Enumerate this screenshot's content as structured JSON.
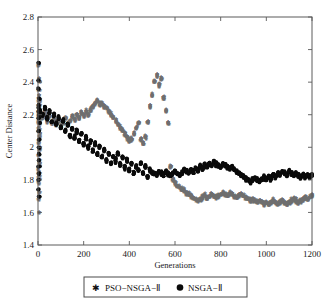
{
  "figure": {
    "width": 330,
    "height": 303,
    "background": "#ffffff"
  },
  "chart_data": {
    "type": "scatter",
    "title": "",
    "xlabel": "Generations",
    "ylabel": "Center Distance",
    "xlim": [
      0,
      1200
    ],
    "ylim": [
      1.4,
      2.8
    ],
    "xticks": [
      0,
      200,
      400,
      600,
      800,
      1000,
      1200
    ],
    "yticks": [
      1.4,
      1.6,
      1.8,
      2,
      2.2,
      2.4,
      2.6,
      2.8
    ],
    "xtick_labels": [
      "0",
      "200",
      "400",
      "600",
      "800",
      "1000",
      "1200"
    ],
    "ytick_labels": [
      "1.4",
      "1.6",
      "1.8",
      "2",
      "2.2",
      "2.4",
      "2.6",
      "2.8"
    ],
    "grid": false,
    "frame": "box",
    "tick_direction": "in",
    "legend_position": "below-axes",
    "series": [
      {
        "name": "PSO−NSGA−Ⅱ",
        "marker": "star",
        "color": "#6e6e6e",
        "x": [
          0,
          0,
          0,
          0,
          0,
          0,
          0,
          0,
          0,
          0,
          0,
          0,
          0,
          0,
          0,
          0,
          0,
          0,
          0,
          0,
          0,
          0,
          0,
          0,
          0,
          0,
          0,
          0,
          0,
          0,
          0,
          0,
          0,
          0,
          0,
          0,
          0,
          0,
          0,
          0,
          10,
          20,
          30,
          40,
          50,
          60,
          70,
          80,
          90,
          100,
          110,
          120,
          130,
          140,
          150,
          160,
          170,
          180,
          190,
          200,
          210,
          220,
          230,
          240,
          250,
          260,
          270,
          280,
          290,
          300,
          310,
          320,
          330,
          340,
          350,
          360,
          370,
          380,
          390,
          400,
          410,
          420,
          430,
          440,
          450,
          460,
          470,
          480,
          490,
          500,
          510,
          520,
          530,
          540,
          550,
          560,
          570,
          580,
          590,
          600,
          610,
          620,
          630,
          640,
          650,
          660,
          670,
          680,
          690,
          700,
          710,
          720,
          730,
          740,
          750,
          760,
          770,
          780,
          790,
          800,
          810,
          820,
          830,
          840,
          850,
          860,
          870,
          880,
          890,
          900,
          910,
          920,
          930,
          940,
          950,
          960,
          970,
          980,
          990,
          1000,
          1010,
          1020,
          1030,
          1040,
          1050,
          1060,
          1070,
          1080,
          1090,
          1100,
          1110,
          1120,
          1130,
          1140,
          1150,
          1160,
          1170,
          1180,
          1190,
          1200
        ],
        "y": [
          2.5,
          2.42,
          2.4,
          2.35,
          2.32,
          2.3,
          2.28,
          2.26,
          2.25,
          2.24,
          2.23,
          2.22,
          2.21,
          2.2,
          2.19,
          2.18,
          2.17,
          2.16,
          2.15,
          2.14,
          2.12,
          2.1,
          2.08,
          2.06,
          2.04,
          2.02,
          2.0,
          1.98,
          1.95,
          1.92,
          1.9,
          1.88,
          1.86,
          1.84,
          1.82,
          1.8,
          1.78,
          1.72,
          1.68,
          1.6,
          2.2,
          2.18,
          2.21,
          2.16,
          2.19,
          2.15,
          2.17,
          2.14,
          2.16,
          2.13,
          2.15,
          2.18,
          2.14,
          2.16,
          2.19,
          2.17,
          2.2,
          2.18,
          2.21,
          2.19,
          2.22,
          2.2,
          2.23,
          2.25,
          2.27,
          2.28,
          2.26,
          2.27,
          2.25,
          2.24,
          2.22,
          2.2,
          2.18,
          2.16,
          2.14,
          2.12,
          2.1,
          2.08,
          2.06,
          2.04,
          2.05,
          2.08,
          2.12,
          2.15,
          2.05,
          2.02,
          2.06,
          2.15,
          2.25,
          2.32,
          2.4,
          2.44,
          2.38,
          2.42,
          2.3,
          2.22,
          2.15,
          1.88,
          1.8,
          1.78,
          1.76,
          1.75,
          1.74,
          1.73,
          1.72,
          1.71,
          1.7,
          1.69,
          1.68,
          1.67,
          1.68,
          1.69,
          1.7,
          1.69,
          1.7,
          1.71,
          1.7,
          1.69,
          1.7,
          1.71,
          1.72,
          1.71,
          1.7,
          1.72,
          1.71,
          1.7,
          1.69,
          1.7,
          1.71,
          1.7,
          1.69,
          1.68,
          1.67,
          1.68,
          1.67,
          1.66,
          1.67,
          1.66,
          1.65,
          1.66,
          1.65,
          1.66,
          1.67,
          1.66,
          1.65,
          1.66,
          1.67,
          1.66,
          1.65,
          1.66,
          1.67,
          1.68,
          1.67,
          1.66,
          1.67,
          1.68,
          1.69,
          1.68,
          1.69,
          1.7
        ]
      },
      {
        "name": "NSGA−Ⅱ",
        "marker": "circle",
        "color": "#0a0a0a",
        "x": [
          0,
          0,
          0,
          0,
          0,
          0,
          0,
          0,
          0,
          0,
          0,
          0,
          0,
          0,
          0,
          0,
          0,
          0,
          0,
          0,
          10,
          20,
          30,
          40,
          50,
          60,
          70,
          80,
          90,
          100,
          110,
          120,
          130,
          140,
          150,
          160,
          170,
          180,
          190,
          200,
          210,
          220,
          230,
          240,
          250,
          260,
          270,
          280,
          290,
          300,
          310,
          320,
          330,
          340,
          350,
          360,
          370,
          380,
          390,
          400,
          410,
          420,
          430,
          440,
          450,
          460,
          470,
          480,
          490,
          500,
          510,
          520,
          530,
          540,
          550,
          560,
          570,
          580,
          590,
          600,
          610,
          620,
          630,
          640,
          650,
          660,
          670,
          680,
          690,
          700,
          710,
          720,
          730,
          740,
          750,
          760,
          770,
          780,
          790,
          800,
          810,
          820,
          830,
          840,
          850,
          860,
          870,
          880,
          890,
          900,
          910,
          920,
          930,
          940,
          950,
          960,
          970,
          980,
          990,
          1000,
          1010,
          1020,
          1030,
          1040,
          1050,
          1060,
          1070,
          1080,
          1090,
          1100,
          1110,
          1120,
          1130,
          1140,
          1150,
          1160,
          1170,
          1180,
          1190,
          1200
        ],
        "y": [
          2.52,
          2.41,
          2.36,
          2.3,
          2.26,
          2.24,
          2.22,
          2.2,
          2.18,
          2.15,
          2.1,
          2.05,
          2.0,
          1.96,
          1.92,
          1.88,
          1.84,
          1.8,
          1.74,
          1.7,
          2.22,
          2.2,
          2.24,
          2.18,
          2.22,
          2.16,
          2.2,
          2.14,
          2.18,
          2.12,
          2.16,
          2.1,
          2.14,
          2.08,
          2.12,
          2.06,
          2.1,
          2.04,
          2.08,
          2.02,
          2.06,
          2.0,
          2.04,
          1.98,
          2.02,
          1.96,
          2.0,
          1.94,
          1.98,
          1.92,
          1.96,
          1.9,
          1.94,
          1.92,
          1.96,
          1.9,
          1.94,
          1.88,
          1.92,
          1.86,
          1.9,
          1.84,
          1.88,
          1.86,
          1.9,
          1.84,
          1.88,
          1.82,
          1.86,
          1.84,
          1.84,
          1.83,
          1.85,
          1.84,
          1.83,
          1.85,
          1.84,
          1.83,
          1.84,
          1.85,
          1.84,
          1.83,
          1.84,
          1.86,
          1.85,
          1.84,
          1.86,
          1.85,
          1.87,
          1.86,
          1.88,
          1.87,
          1.89,
          1.88,
          1.9,
          1.89,
          1.91,
          1.9,
          1.89,
          1.88,
          1.9,
          1.89,
          1.88,
          1.87,
          1.88,
          1.86,
          1.85,
          1.84,
          1.83,
          1.82,
          1.81,
          1.8,
          1.79,
          1.8,
          1.81,
          1.8,
          1.79,
          1.8,
          1.81,
          1.8,
          1.82,
          1.81,
          1.83,
          1.82,
          1.84,
          1.83,
          1.85,
          1.84,
          1.83,
          1.85,
          1.84,
          1.83,
          1.84,
          1.83,
          1.82,
          1.83,
          1.82,
          1.83,
          1.82,
          1.83
        ]
      }
    ]
  },
  "legend": {
    "items": [
      {
        "label": "PSO−NSGA−Ⅱ",
        "marker": "star"
      },
      {
        "label": "NSGA−Ⅱ",
        "marker": "circle"
      }
    ]
  }
}
